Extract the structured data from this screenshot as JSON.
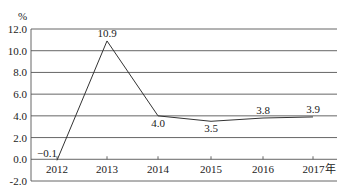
{
  "chart_data": {
    "type": "line",
    "title": "",
    "xlabel": "",
    "ylabel": "%",
    "categories": [
      "2012",
      "2013",
      "2014",
      "2015",
      "2016",
      "2017年"
    ],
    "series": [
      {
        "name": "growth",
        "values": [
          -0.1,
          10.9,
          4.0,
          3.5,
          3.8,
          3.9
        ]
      }
    ],
    "data_labels": [
      "−0.1",
      "10.9",
      "4.0",
      "3.5",
      "3.8",
      "3.9"
    ],
    "yticks": [
      "12.0",
      "10.0",
      "8.0",
      "6.0",
      "4.0",
      "2.0",
      "0.0",
      "-2.0"
    ],
    "ylim": [
      -2.0,
      12.0
    ],
    "grid": true,
    "legend": null
  }
}
